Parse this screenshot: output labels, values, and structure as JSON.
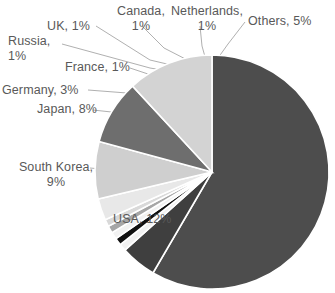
{
  "chart_data": {
    "type": "pie",
    "title": "",
    "subtitle": "",
    "xlabel": "",
    "ylabel": "",
    "legend_position": "none",
    "grid": false,
    "units": "percent",
    "label_format": "{name}, {value}%",
    "start_angle_deg": -90,
    "direction": "clockwise",
    "categories": [
      "China",
      "Others",
      "Netherlands",
      "Canada",
      "UK",
      "Russia",
      "France",
      "Germany",
      "Japan",
      "South Korea",
      "USA"
    ],
    "values": [
      59,
      5,
      1,
      1,
      1,
      1,
      1,
      3,
      8,
      9,
      12
    ],
    "colors": [
      "#4d4d4d",
      "#3f3f3f",
      "#f2f2f2",
      "#111111",
      "#f2f2f2",
      "#a6a6a6",
      "#d9d9d9",
      "#e8e8e8",
      "#cfcfcf",
      "#6e6e6e",
      "#d3d3d3"
    ],
    "slices": [
      {
        "name": "China",
        "value": 59,
        "label": "",
        "color": "#4d4d4d",
        "inner_label": true,
        "inner_text": "China, 59%"
      },
      {
        "name": "Others",
        "value": 5,
        "label": "Others, 5%",
        "color": "#3f3f3f",
        "inner_label": false
      },
      {
        "name": "Netherlands",
        "value": 1,
        "label": "Netherlands,\n1%",
        "color": "#f2f2f2",
        "inner_label": false
      },
      {
        "name": "Canada",
        "value": 1,
        "label": "Canada,\n1%",
        "color": "#111111",
        "inner_label": false
      },
      {
        "name": "UK",
        "value": 1,
        "label": "UK, 1%",
        "color": "#f2f2f2",
        "inner_label": false
      },
      {
        "name": "Russia",
        "value": 1,
        "label": "Russia,\n1%",
        "color": "#a6a6a6",
        "inner_label": false
      },
      {
        "name": "France",
        "value": 1,
        "label": "France, 1%",
        "color": "#d9d9d9",
        "inner_label": false
      },
      {
        "name": "Germany",
        "value": 3,
        "label": "Germany, 3%",
        "color": "#e8e8e8",
        "inner_label": false
      },
      {
        "name": "Japan",
        "value": 8,
        "label": "Japan, 8%",
        "color": "#cfcfcf",
        "inner_label": false
      },
      {
        "name": "South Korea",
        "value": 9,
        "label": "South Korea,\n9%",
        "color": "#6e6e6e",
        "inner_label": false
      },
      {
        "name": "USA",
        "value": 12,
        "label": "USA, 12%",
        "color": "#d3d3d3",
        "inner_label": false
      }
    ]
  },
  "labels": {
    "russia": "Russia,\n1%",
    "uk": "UK, 1%",
    "canada": "Canada,\n1%",
    "netherlands": "Netherlands,\n1%",
    "others": "Others, 5%",
    "france": "France, 1%",
    "germany": "Germany, 3%",
    "japan": "Japan, 8%",
    "south_korea": "South Korea,\n9%",
    "usa": "USA, 12%",
    "china_inner": "China, 59%"
  },
  "style": {
    "background": "#ffffff",
    "label_color": "#595959",
    "leader_line_color": "#b0b0b0",
    "slice_border_color": "#ffffff"
  }
}
